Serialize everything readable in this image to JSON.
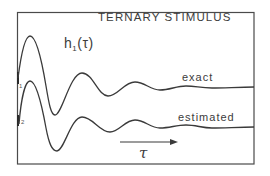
{
  "figure": {
    "title": "TERNARY STIMULUS",
    "function_label": {
      "base": "h",
      "subscript": "1",
      "argument": "(τ)"
    },
    "curves": [
      {
        "id": "1",
        "label": "exact",
        "marker": "1"
      },
      {
        "id": "2",
        "label": "estimated",
        "marker": "2"
      }
    ],
    "axis_arrow_label": "τ",
    "colors": {
      "line": "#3a3a3a",
      "frame": "#4a4a4a",
      "background": "#ffffff"
    }
  }
}
